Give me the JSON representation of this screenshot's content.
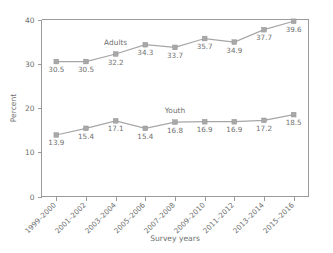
{
  "chart_data": {
    "type": "line",
    "title": "",
    "xlabel": "Survey years",
    "ylabel": "Percent",
    "ylim": [
      0,
      40
    ],
    "yticks": [
      0,
      10,
      20,
      30,
      40
    ],
    "grid": false,
    "legend_position": "inline-annotation",
    "categories": [
      "1999–2000",
      "2001–2002",
      "2003–2004",
      "2005–2006",
      "2007–2008",
      "2009–2010",
      "2011–2012",
      "2013–2014",
      "2015–2016"
    ],
    "series": [
      {
        "name": "Adults",
        "color": "#a6a6a6",
        "values": [
          30.5,
          30.5,
          32.2,
          34.3,
          33.7,
          35.7,
          34.9,
          37.7,
          39.6
        ],
        "labels": [
          "30.5",
          "30.5",
          "32.2",
          "34.3",
          "33.7",
          "35.7",
          "34.9",
          "37.7",
          "39.6"
        ]
      },
      {
        "name": "Youth",
        "color": "#a6a6a6",
        "values": [
          13.9,
          15.4,
          17.1,
          15.4,
          16.8,
          16.9,
          16.9,
          17.2,
          18.5
        ],
        "labels": [
          "13.9",
          "15.4",
          "17.1",
          "15.4",
          "16.8",
          "16.9",
          "16.9",
          "17.2",
          "18.5"
        ]
      }
    ],
    "annotations": [
      {
        "text": "Adults",
        "series": "Adults",
        "near_category": "2003–2004"
      },
      {
        "text": "Youth",
        "series": "Youth",
        "near_category": "2007–2008"
      }
    ]
  },
  "axis": {
    "y_tick_labels": [
      "0",
      "10",
      "20",
      "30",
      "40"
    ],
    "y_title": "Percent",
    "x_title": "Survey years"
  },
  "colors": {
    "line": "#a6a6a6",
    "marker": "#a8a8a8",
    "axis": "#9a9a9a",
    "text": "#6f6f6f",
    "background": "#ffffff"
  }
}
